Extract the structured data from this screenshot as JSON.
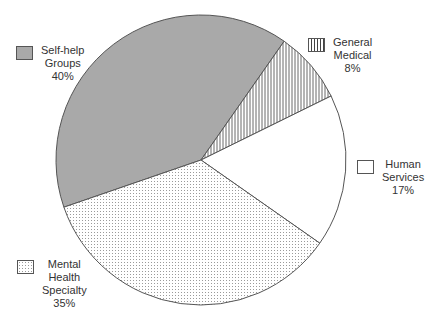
{
  "chart_data": {
    "type": "pie",
    "title": "",
    "categories": [
      "Self-help Groups",
      "General Medical",
      "Human Services",
      "Mental Health Specialty"
    ],
    "values": [
      40,
      8,
      17,
      35
    ],
    "unit": "%",
    "patterns": [
      "solid-gray",
      "vertical-lines",
      "white",
      "dotted"
    ],
    "colors": [
      "#a9a9a9",
      "#ffffff",
      "#ffffff",
      "#ffffff"
    ],
    "legend_position": "around-pie"
  },
  "legend": [
    {
      "line1": "Self-help",
      "line2": "Groups",
      "line3": "",
      "pct": "40%"
    },
    {
      "line1": "General",
      "line2": "Medical",
      "line3": "",
      "pct": "8%"
    },
    {
      "line1": "Human",
      "line2": "Services",
      "line3": "",
      "pct": "17%"
    },
    {
      "line1": "Mental",
      "line2": "Health",
      "line3": "Specialty",
      "pct": "35%"
    }
  ]
}
